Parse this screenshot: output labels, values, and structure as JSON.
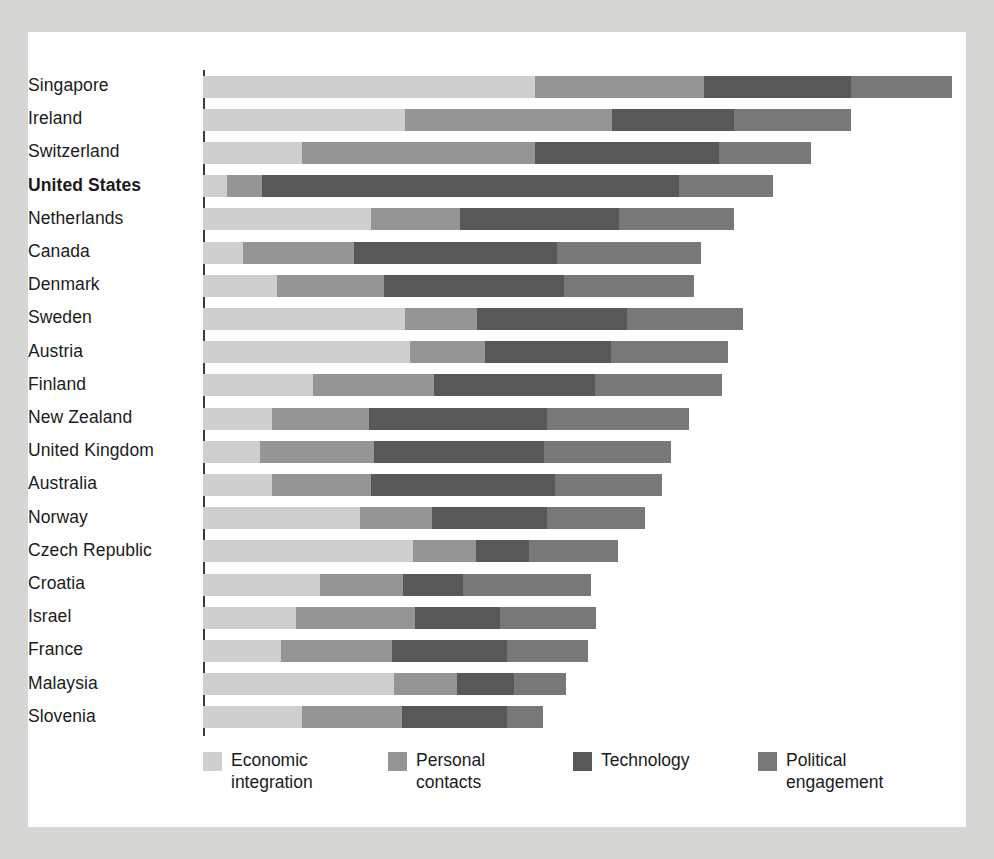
{
  "chart_data": {
    "type": "bar",
    "subtype": "stacked-horizontal",
    "title": "",
    "xlabel": "",
    "ylabel": "",
    "grid": false,
    "legend_position": "bottom",
    "axis_max": 100,
    "series": [
      {
        "name": "Economic integration",
        "key": "economic",
        "color": "#cfcfcf",
        "values": [
          43.6,
          26.5,
          13.0,
          3.1,
          22.0,
          5.2,
          9.7,
          26.5,
          27.2,
          14.5,
          9.0,
          7.5,
          9.0,
          20.6,
          27.5,
          15.4,
          12.2,
          10.2,
          25.1,
          13.0
        ]
      },
      {
        "name": "Personal contacts",
        "key": "personal",
        "color": "#959595",
        "values": [
          22.2,
          27.2,
          30.6,
          4.6,
          11.7,
          14.6,
          14.0,
          9.5,
          9.8,
          15.8,
          12.8,
          15.0,
          13.1,
          9.5,
          8.3,
          10.8,
          15.6,
          14.6,
          8.3,
          13.1
        ]
      },
      {
        "name": "Technology",
        "key": "technology",
        "color": "#585858",
        "values": [
          19.2,
          16.0,
          24.1,
          54.8,
          20.9,
          26.7,
          23.7,
          19.6,
          16.6,
          21.1,
          23.3,
          22.3,
          24.1,
          15.0,
          7.0,
          7.9,
          11.2,
          15.1,
          7.4,
          13.8
        ]
      },
      {
        "name": "Political engagement",
        "key": "political",
        "color": "#787878",
        "values": [
          13.3,
          15.4,
          12.1,
          12.3,
          15.1,
          18.8,
          17.0,
          15.3,
          15.3,
          16.7,
          18.7,
          16.6,
          14.1,
          12.9,
          11.6,
          16.8,
          12.6,
          10.6,
          6.9,
          4.7
        ]
      }
    ],
    "categories": [
      "Singapore",
      "Ireland",
      "Switzerland",
      "United States",
      "Netherlands",
      "Canada",
      "Denmark",
      "Sweden",
      "Austria",
      "Finland",
      "New Zealand",
      "United Kingdom",
      "Australia",
      "Norway",
      "Czech Republic",
      "Croatia",
      "Israel",
      "France",
      "Malaysia",
      "Slovenia"
    ],
    "totals": [
      98.3,
      85.1,
      79.8,
      74.8,
      69.7,
      65.3,
      64.4,
      70.9,
      68.9,
      68.1,
      63.8,
      61.4,
      60.3,
      58.0,
      54.4,
      50.9,
      51.6,
      50.5,
      47.7,
      44.6
    ],
    "highlighted_category": "United States"
  },
  "rows": [
    {
      "label": "Singapore",
      "bold": false,
      "economic": 43.6,
      "personal": 22.2,
      "technology": 19.2,
      "political": 13.3
    },
    {
      "label": "Ireland",
      "bold": false,
      "economic": 26.5,
      "personal": 27.2,
      "technology": 16.0,
      "political": 15.4
    },
    {
      "label": "Switzerland",
      "bold": false,
      "economic": 13.0,
      "personal": 30.6,
      "technology": 24.1,
      "political": 12.1
    },
    {
      "label": "United States",
      "bold": true,
      "economic": 3.1,
      "personal": 4.6,
      "technology": 54.8,
      "political": 12.3
    },
    {
      "label": "Netherlands",
      "bold": false,
      "economic": 22.0,
      "personal": 11.7,
      "technology": 20.9,
      "political": 15.1
    },
    {
      "label": "Canada",
      "bold": false,
      "economic": 5.2,
      "personal": 14.6,
      "technology": 26.7,
      "political": 18.8
    },
    {
      "label": "Denmark",
      "bold": false,
      "economic": 9.7,
      "personal": 14.0,
      "technology": 23.7,
      "political": 17.0
    },
    {
      "label": "Sweden",
      "bold": false,
      "economic": 26.5,
      "personal": 9.5,
      "technology": 19.6,
      "political": 15.3
    },
    {
      "label": "Austria",
      "bold": false,
      "economic": 27.2,
      "personal": 9.8,
      "technology": 16.6,
      "political": 15.3
    },
    {
      "label": "Finland",
      "bold": false,
      "economic": 14.5,
      "personal": 15.8,
      "technology": 21.1,
      "political": 16.7
    },
    {
      "label": "New Zealand",
      "bold": false,
      "economic": 9.0,
      "personal": 12.8,
      "technology": 23.3,
      "political": 18.7
    },
    {
      "label": "United Kingdom",
      "bold": false,
      "economic": 7.5,
      "personal": 15.0,
      "technology": 22.3,
      "political": 16.6
    },
    {
      "label": "Australia",
      "bold": false,
      "economic": 9.0,
      "personal": 13.1,
      "technology": 24.1,
      "political": 14.1
    },
    {
      "label": "Norway",
      "bold": false,
      "economic": 20.6,
      "personal": 9.5,
      "technology": 15.0,
      "political": 12.9
    },
    {
      "label": "Czech Republic",
      "bold": false,
      "economic": 27.5,
      "personal": 8.3,
      "technology": 7.0,
      "political": 11.6
    },
    {
      "label": "Croatia",
      "bold": false,
      "economic": 15.4,
      "personal": 10.8,
      "technology": 7.9,
      "political": 16.8
    },
    {
      "label": "Israel",
      "bold": false,
      "economic": 12.2,
      "personal": 15.6,
      "technology": 11.2,
      "political": 12.6
    },
    {
      "label": "France",
      "bold": false,
      "economic": 10.2,
      "personal": 14.6,
      "technology": 15.1,
      "political": 10.6
    },
    {
      "label": "Malaysia",
      "bold": false,
      "economic": 25.1,
      "personal": 8.3,
      "technology": 7.4,
      "political": 6.9
    },
    {
      "label": "Slovenia",
      "bold": false,
      "economic": 13.0,
      "personal": 13.1,
      "technology": 13.8,
      "political": 4.7
    }
  ],
  "legend": {
    "items": [
      {
        "label": "Economic\nintegration",
        "key": "economic",
        "color": "#cfcfcf"
      },
      {
        "label": "Personal\ncontacts",
        "key": "personal",
        "color": "#959595"
      },
      {
        "label": "Technology",
        "key": "technology",
        "color": "#585858"
      },
      {
        "label": "Political\nengagement",
        "key": "political",
        "color": "#787878"
      }
    ]
  }
}
